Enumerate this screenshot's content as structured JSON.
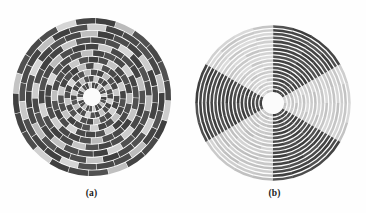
{
  "page": {
    "width": 366,
    "height": 213,
    "background": "#fefefe",
    "document_type": "figure",
    "figure_label": ""
  },
  "panels": [
    {
      "id": "a",
      "caption": "(a)",
      "center_x": 92,
      "center_y": 97,
      "outer_radius": 80,
      "hub_radius": 9,
      "rings": 11,
      "sectors": 24,
      "ring_gap": 0.9,
      "sector_gap": 0.6,
      "pattern": "spiral-scatter",
      "description": "concentric rings of angular segments with scattered gray levels forming spiral arms"
    },
    {
      "id": "b",
      "caption": "(b)",
      "center_x": 273,
      "center_y": 103,
      "outer_radius": 79,
      "hub_radius": 11,
      "rings": 18,
      "sectors": 24,
      "ring_gap": 1.25,
      "sector_gap": 0.0,
      "pattern": "sector-coherent",
      "description": "concentric rings grouped into large uniform angular wedges of alternating light and dark gray"
    }
  ],
  "chart_data": {
    "type": "heatmap",
    "title": "",
    "subtitle": "",
    "xlabel": "",
    "ylabel": "",
    "projection": "polar",
    "colormap": "grayscale",
    "value_range": [
      0,
      1
    ],
    "legend": "none",
    "grid": false,
    "panel_labels": [
      "(a)",
      "(b)"
    ],
    "gray_levels": {
      "darkest": "#1f1f1f",
      "dark": "#3a3a3a",
      "mid_dark": "#5a5a5a",
      "mid": "#7c7c7c",
      "mid_light": "#9e9e9e",
      "light": "#c2c2c2",
      "lightest": "#e4e4e4",
      "hub": "#fbfbfb",
      "gap": "#fdfdfd"
    },
    "panel_a": {
      "description": "polar heatmap, 11 radial rings x 24 angular sectors, disordered / spiral arrangement",
      "rings": 11,
      "sectors": 24,
      "matrix": [
        [
          0.22,
          0.18,
          0.8,
          0.3,
          0.24,
          0.86,
          0.2,
          0.26,
          0.78,
          0.22,
          0.2,
          0.84,
          0.28,
          0.22,
          0.76,
          0.24,
          0.2,
          0.88,
          0.26,
          0.22,
          0.8,
          0.24,
          0.18,
          0.82
        ],
        [
          0.84,
          0.24,
          0.2,
          0.78,
          0.26,
          0.22,
          0.86,
          0.2,
          0.24,
          0.8,
          0.22,
          0.26,
          0.88,
          0.24,
          0.2,
          0.76,
          0.28,
          0.22,
          0.84,
          0.2,
          0.24,
          0.78,
          0.26,
          0.22
        ],
        [
          0.2,
          0.76,
          0.26,
          0.22,
          0.82,
          0.24,
          0.2,
          0.86,
          0.22,
          0.26,
          0.78,
          0.2,
          0.24,
          0.84,
          0.26,
          0.22,
          0.8,
          0.24,
          0.2,
          0.88,
          0.22,
          0.26,
          0.76,
          0.24
        ],
        [
          0.26,
          0.22,
          0.18,
          0.84,
          0.2,
          0.26,
          0.22,
          0.78,
          0.24,
          0.2,
          0.86,
          0.26,
          0.22,
          0.18,
          0.8,
          0.24,
          0.26,
          0.82,
          0.2,
          0.24,
          0.18,
          0.76,
          0.22,
          0.86
        ],
        [
          0.8,
          0.22,
          0.26,
          0.2,
          0.76,
          0.24,
          0.22,
          0.18,
          0.84,
          0.26,
          0.2,
          0.22,
          0.88,
          0.24,
          0.18,
          0.26,
          0.78,
          0.22,
          0.24,
          0.2,
          0.82,
          0.26,
          0.18,
          0.24
        ],
        [
          0.22,
          0.86,
          0.2,
          0.24,
          0.26,
          0.8,
          0.18,
          0.22,
          0.24,
          0.76,
          0.26,
          0.2,
          0.22,
          0.84,
          0.24,
          0.18,
          0.2,
          0.88,
          0.26,
          0.22,
          0.24,
          0.78,
          0.2,
          0.26
        ],
        [
          0.24,
          0.2,
          0.78,
          0.26,
          0.18,
          0.22,
          0.84,
          0.24,
          0.2,
          0.26,
          0.8,
          0.22,
          0.18,
          0.24,
          0.86,
          0.2,
          0.26,
          0.22,
          0.76,
          0.24,
          0.18,
          0.2,
          0.82,
          0.22
        ],
        [
          0.18,
          0.26,
          0.22,
          0.76,
          0.24,
          0.2,
          0.26,
          0.86,
          0.18,
          0.22,
          0.24,
          0.78,
          0.2,
          0.26,
          0.22,
          0.84,
          0.24,
          0.18,
          0.2,
          0.8,
          0.26,
          0.22,
          0.24,
          0.88
        ],
        [
          0.84,
          0.18,
          0.24,
          0.2,
          0.86,
          0.26,
          0.22,
          0.18,
          0.8,
          0.24,
          0.2,
          0.26,
          0.76,
          0.22,
          0.18,
          0.24,
          0.88,
          0.2,
          0.26,
          0.22,
          0.78,
          0.18,
          0.24,
          0.2
        ],
        [
          0.22,
          0.8,
          0.18,
          0.26,
          0.2,
          0.76,
          0.24,
          0.22,
          0.26,
          0.88,
          0.18,
          0.2,
          0.24,
          0.82,
          0.26,
          0.22,
          0.2,
          0.78,
          0.18,
          0.24,
          0.86,
          0.2,
          0.22,
          0.26
        ],
        [
          0.26,
          0.22,
          0.84,
          0.18,
          0.22,
          0.2,
          0.78,
          0.26,
          0.22,
          0.18,
          0.86,
          0.24,
          0.2,
          0.18,
          0.8,
          0.26,
          0.22,
          0.24,
          0.88,
          0.2,
          0.18,
          0.76,
          0.26,
          0.22
        ]
      ]
    },
    "panel_b": {
      "description": "polar heatmap, 18 radial rings x 24 angular sectors, values coherent within large angular wedges",
      "rings": 18,
      "sectors": 24,
      "sector_values": [
        0.24,
        0.22,
        0.2,
        0.22,
        0.78,
        0.82,
        0.86,
        0.88,
        0.84,
        0.8,
        0.26,
        0.22,
        0.2,
        0.24,
        0.22,
        0.8,
        0.84,
        0.88,
        0.82,
        0.26,
        0.22,
        0.2,
        0.24,
        0.22
      ],
      "wedges": [
        {
          "start_deg": 272,
          "end_deg": 330,
          "gray": 0.22,
          "label": "dark-upper-right"
        },
        {
          "start_deg": 330,
          "end_deg": 30,
          "gray": 0.84,
          "label": "light-right"
        },
        {
          "start_deg": 30,
          "end_deg": 88,
          "gray": 0.22,
          "label": "dark-lower-right"
        },
        {
          "start_deg": 88,
          "end_deg": 146,
          "gray": 0.82,
          "label": "light-lower-left"
        },
        {
          "start_deg": 146,
          "end_deg": 212,
          "gray": 0.21,
          "label": "dark-left"
        },
        {
          "start_deg": 212,
          "end_deg": 272,
          "gray": 0.86,
          "label": "light-upper-left"
        }
      ]
    }
  }
}
